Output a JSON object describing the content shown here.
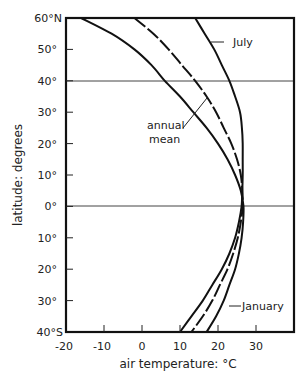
{
  "chart_data": {
    "type": "line",
    "title": "",
    "xlabel": "air temperature: °C",
    "ylabel": "latitude: degrees",
    "xlim": [
      -20,
      40
    ],
    "ylim": [
      -40,
      60
    ],
    "x_ticks": [
      -20,
      -10,
      0,
      10,
      20,
      30
    ],
    "x_tick_labels": [
      "-20",
      "-10",
      "0",
      "10",
      "20",
      "30"
    ],
    "y_ticks": [
      60,
      50,
      40,
      30,
      20,
      10,
      0,
      -10,
      -20,
      -30,
      -40
    ],
    "y_tick_labels": [
      "60°N",
      "50°",
      "40°",
      "30°",
      "20°",
      "10°",
      "0°",
      "10°",
      "20°",
      "30°",
      "40°S"
    ],
    "reference_lines": [
      {
        "axis": "y",
        "value": 40
      },
      {
        "axis": "y",
        "value": 0
      }
    ],
    "grid": false,
    "legend": "inline annotations",
    "series": [
      {
        "name": "July",
        "style": "solid",
        "latitude": [
          60,
          55,
          50,
          45,
          40,
          35,
          30,
          25,
          20,
          15,
          10,
          5,
          0,
          -5,
          -10,
          -15,
          -20,
          -25,
          -30,
          -35,
          -40
        ],
        "temperature": [
          14,
          16.5,
          19,
          21,
          23,
          24.5,
          25.8,
          26.3,
          26.5,
          26.5,
          26.5,
          26.4,
          26.2,
          25.5,
          24.5,
          23,
          21,
          18.5,
          16,
          13,
          10
        ]
      },
      {
        "name": "annual mean",
        "style": "dashed",
        "latitude": [
          60,
          55,
          50,
          45,
          40,
          35,
          30,
          25,
          20,
          15,
          10,
          5,
          0,
          -5,
          -10,
          -15,
          -20,
          -25,
          -30,
          -35,
          -40
        ],
        "temperature": [
          -2,
          3,
          7,
          10.5,
          14,
          17,
          19.5,
          21.5,
          23.5,
          25,
          26,
          26.4,
          26.5,
          26,
          25.2,
          24,
          22.5,
          20.5,
          18.5,
          16,
          13
        ]
      },
      {
        "name": "January",
        "style": "solid",
        "latitude": [
          60,
          55,
          50,
          45,
          40,
          35,
          30,
          25,
          20,
          15,
          10,
          5,
          0,
          -5,
          -10,
          -15,
          -20,
          -25,
          -30,
          -35,
          -40
        ],
        "temperature": [
          -16,
          -8,
          -2,
          2.5,
          6,
          10,
          13.5,
          17,
          20,
          22.5,
          24.5,
          26,
          26.7,
          26.6,
          26.2,
          25.5,
          24.5,
          23,
          21.5,
          19.5,
          17
        ]
      }
    ],
    "annotations": [
      {
        "text": "July",
        "points_to": "July"
      },
      {
        "text": "annual mean",
        "points_to": "annual mean"
      },
      {
        "text": "January",
        "points_to": "January"
      }
    ]
  },
  "labels": {
    "xlabel": "air temperature: °C",
    "ylabel": "latitude: degrees",
    "july": "July",
    "annual_1": "annual",
    "annual_2": "mean",
    "january": "January",
    "x_ticks": [
      "-20",
      "-10",
      "0",
      "10",
      "20",
      "30"
    ],
    "y_ticks": [
      "60°N",
      "50°",
      "40°",
      "30°",
      "20°",
      "10°",
      "0°",
      "10°",
      "20°",
      "30°",
      "40°S"
    ]
  }
}
